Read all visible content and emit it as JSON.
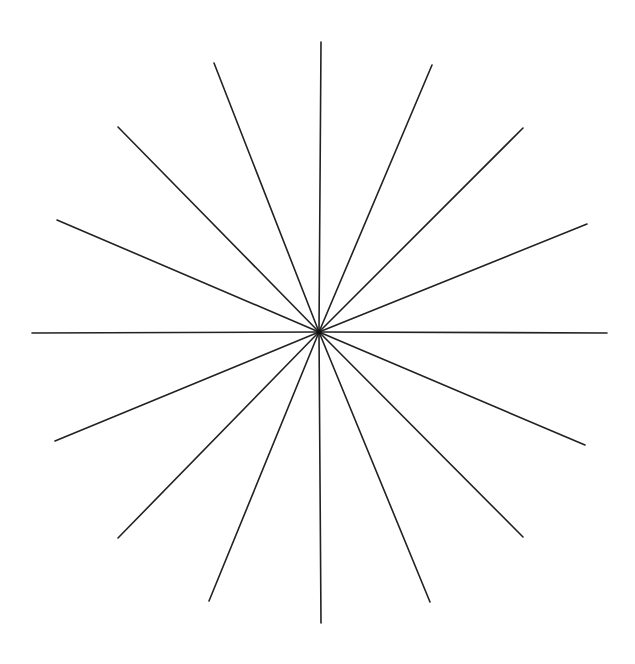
{
  "figure": {
    "title": "",
    "background": "#ffffff",
    "stroke_color": "#222222",
    "stroke_width": 1.6,
    "center": {
      "x": 319,
      "y": 332
    },
    "ray_count": 16,
    "rays": [
      {
        "name": "ray-top",
        "x2": 321,
        "y2": 42
      },
      {
        "name": "ray-top-right",
        "x2": 432,
        "y2": 65
      },
      {
        "name": "ray-upper-right-diagonal",
        "x2": 523,
        "y2": 128
      },
      {
        "name": "ray-right-upper",
        "x2": 587,
        "y2": 224
      },
      {
        "name": "ray-right",
        "x2": 607,
        "y2": 333
      },
      {
        "name": "ray-right-lower",
        "x2": 585,
        "y2": 445
      },
      {
        "name": "ray-lower-right-diagonal",
        "x2": 523,
        "y2": 537
      },
      {
        "name": "ray-bottom-right",
        "x2": 430,
        "y2": 602
      },
      {
        "name": "ray-bottom",
        "x2": 321,
        "y2": 623
      },
      {
        "name": "ray-bottom-left",
        "x2": 209,
        "y2": 601
      },
      {
        "name": "ray-lower-left-diagonal",
        "x2": 118,
        "y2": 538
      },
      {
        "name": "ray-left-lower",
        "x2": 55,
        "y2": 441
      },
      {
        "name": "ray-left",
        "x2": 32,
        "y2": 333
      },
      {
        "name": "ray-left-upper",
        "x2": 57,
        "y2": 220
      },
      {
        "name": "ray-upper-left-diagonal",
        "x2": 118,
        "y2": 127
      },
      {
        "name": "ray-top-left",
        "x2": 214,
        "y2": 63
      }
    ]
  }
}
